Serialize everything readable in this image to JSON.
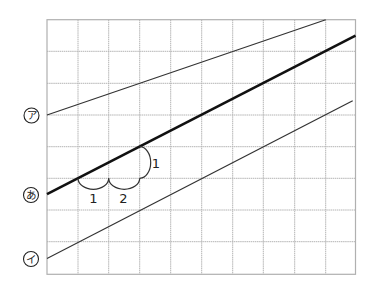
{
  "diagram": {
    "type": "grid-with-parallel-lines",
    "grid": {
      "columns": 10,
      "rows": 8,
      "origin_px": [
        47,
        19.7
      ],
      "cell_width_px": 30.85,
      "cell_height_px": 31.82,
      "line_color": "#b4b4b4"
    },
    "lines": [
      {
        "id": "a",
        "label": "ア",
        "style": "thin",
        "from_cell": [
          0,
          3
        ],
        "to_cell": [
          9,
          0
        ],
        "slope_note": "1 up per 3 across"
      },
      {
        "id": "main",
        "label": "あ",
        "style": "thick",
        "from_cell": [
          0,
          5.5
        ],
        "to_cell": [
          10,
          0.5
        ],
        "slope_note": "1 up per 2 across"
      },
      {
        "id": "i",
        "label": "イ",
        "style": "thin",
        "from_cell": [
          0,
          7.5
        ],
        "to_cell": [
          9.9,
          2.55
        ],
        "slope_note": "1 up per 2 across"
      }
    ],
    "annotations": {
      "horizontal_arc_1": {
        "label": "1",
        "from_cell": [
          1,
          5
        ],
        "to_cell": [
          2,
          5
        ]
      },
      "horizontal_arc_2": {
        "label": "2",
        "from_cell": [
          2,
          5
        ],
        "to_cell": [
          3,
          5
        ]
      },
      "vertical_arc": {
        "label": "1",
        "from_cell": [
          3,
          5
        ],
        "to_cell": [
          3,
          4
        ]
      }
    },
    "labels": {
      "a": "ア",
      "main": "あ",
      "i": "イ",
      "arc_h1": "1",
      "arc_h2": "2",
      "arc_v": "1"
    },
    "colors": {
      "line": "#333333",
      "thick_line": "#111111",
      "grid": "#b4b4b4",
      "background": "#ffffff"
    }
  }
}
